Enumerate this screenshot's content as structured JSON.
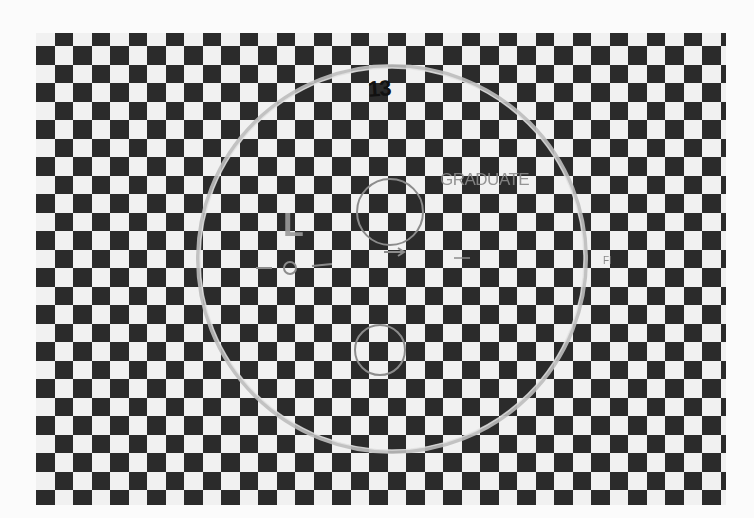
{
  "image": {
    "description": "Photograph of a black-and-white checkerboard test chart viewed through a circular lens/filter with hand-drawn markings",
    "width": 754,
    "height": 518
  },
  "checkerboard": {
    "left": 36,
    "top": 33,
    "width": 690,
    "height": 472,
    "cell_size": 18.5,
    "row_offset": -5.3,
    "col_offset": 0,
    "first_cell_light": true,
    "colors": {
      "dark": "#2f2f2f",
      "light": "#ececec",
      "background": "#fbfbfb"
    }
  },
  "lens": {
    "outer_circle": {
      "cx": 392,
      "cy": 259,
      "rx": 194,
      "ry": 193,
      "stroke": "#b5b5b5"
    },
    "upper_small_circle": {
      "cx": 390,
      "cy": 212,
      "r": 33,
      "stroke": "#8c8c8c"
    },
    "lower_small_circle": {
      "cx": 380,
      "cy": 350,
      "r": 25,
      "stroke": "#8c8c8c"
    },
    "tiny_circle": {
      "cx": 290,
      "cy": 268,
      "r": 6,
      "stroke": "#8c8c8c"
    }
  },
  "annotations": {
    "number": "13",
    "graduate": "GRADUATE",
    "letter": "L",
    "mark": "FI"
  }
}
